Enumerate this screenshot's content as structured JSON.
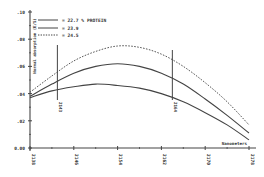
{
  "chart_data": {
    "type": "line",
    "title": "",
    "xlabel": "Nanometers",
    "ylabel": "Normal absorption (E/S)",
    "xlim": [
      2138,
      2178
    ],
    "ylim": [
      0.0,
      0.1
    ],
    "x_ticks": [
      "2138",
      "2146",
      "2154",
      "2162",
      "2170",
      "2178"
    ],
    "y_ticks": [
      ".10",
      ".08",
      ".06",
      ".04",
      ".02",
      "0.00"
    ],
    "grid": false,
    "legend_position": "upper-left",
    "x": [
      2138,
      2142,
      2146,
      2150,
      2154,
      2158,
      2162,
      2166,
      2170,
      2174,
      2178
    ],
    "series": [
      {
        "name": "= 22.7 % PROTEIN",
        "style": "solid",
        "values": [
          0.037,
          0.042,
          0.045,
          0.047,
          0.046,
          0.044,
          0.04,
          0.034,
          0.026,
          0.017,
          0.006
        ]
      },
      {
        "name": "= 23.9",
        "style": "solid",
        "values": [
          0.038,
          0.047,
          0.055,
          0.06,
          0.062,
          0.06,
          0.055,
          0.047,
          0.036,
          0.024,
          0.011
        ]
      },
      {
        "name": "= 24.5",
        "style": "dashed",
        "values": [
          0.041,
          0.053,
          0.064,
          0.071,
          0.075,
          0.074,
          0.069,
          0.06,
          0.048,
          0.034,
          0.017
        ]
      }
    ],
    "annotations": [
      {
        "type": "vertical-line",
        "x": 2143,
        "label": "2143"
      },
      {
        "type": "vertical-line",
        "x": 2164,
        "label": "2164"
      }
    ]
  },
  "legend": {
    "items": [
      {
        "label": "= 22.7 % PROTEIN",
        "style": "solid"
      },
      {
        "label": "= 23.9",
        "style": "solid"
      },
      {
        "label": "= 24.5",
        "style": "dashed"
      }
    ]
  },
  "axes": {
    "xlabel": "Nanometers",
    "ylabel": "Normal absorption (E/S)"
  }
}
